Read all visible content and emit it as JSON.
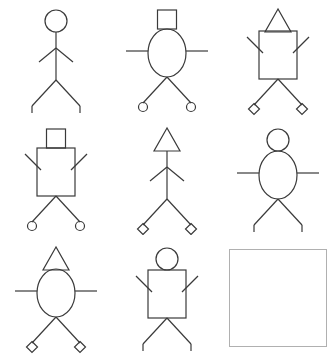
{
  "puzzle": {
    "title": "Stick Figure Matrix",
    "type": "3x3 visual analogy matrix",
    "rows": 3,
    "columns": 3,
    "background_color": "#ffffff",
    "stroke_color": "#3a3a3a",
    "answer_slot_border_color": "#b0b0b0",
    "attributes": {
      "head_shapes": [
        "circle",
        "square",
        "triangle"
      ],
      "torso_shapes": [
        "none",
        "ellipse",
        "rectangle"
      ],
      "arm_positions": [
        "down",
        "horizontal",
        "up"
      ],
      "foot_shapes": [
        "line",
        "circle",
        "diamond"
      ]
    }
  },
  "cells": [
    {
      "index": 1,
      "row": 1,
      "column": 1,
      "name": "figure-1",
      "head": "circle",
      "torso": "none",
      "arms": "down",
      "feet": "line",
      "empty": false,
      "label": "circle head, no torso, arms down, line feet"
    },
    {
      "index": 2,
      "row": 1,
      "column": 2,
      "name": "figure-2",
      "head": "square",
      "torso": "ellipse",
      "arms": "horizontal",
      "feet": "circle",
      "empty": false,
      "label": "square head, ellipse torso, arms horizontal, circle feet"
    },
    {
      "index": 3,
      "row": 1,
      "column": 3,
      "name": "figure-3",
      "head": "triangle",
      "torso": "rectangle",
      "arms": "up",
      "feet": "diamond",
      "empty": false,
      "label": "triangle head, rectangle torso, arms up, diamond feet"
    },
    {
      "index": 4,
      "row": 2,
      "column": 1,
      "name": "figure-4",
      "head": "square",
      "torso": "rectangle",
      "arms": "up",
      "feet": "circle",
      "empty": false,
      "label": "square head, rectangle torso, arms up, circle feet"
    },
    {
      "index": 5,
      "row": 2,
      "column": 2,
      "name": "figure-5",
      "head": "triangle",
      "torso": "none",
      "arms": "down",
      "feet": "diamond",
      "empty": false,
      "label": "triangle head, no torso, arms down, diamond feet"
    },
    {
      "index": 6,
      "row": 2,
      "column": 3,
      "name": "figure-6",
      "head": "circle",
      "torso": "ellipse",
      "arms": "horizontal",
      "feet": "line",
      "empty": false,
      "label": "circle head, ellipse torso, arms horizontal, line feet"
    },
    {
      "index": 7,
      "row": 3,
      "column": 1,
      "name": "figure-7",
      "head": "triangle",
      "torso": "ellipse",
      "arms": "horizontal",
      "feet": "diamond",
      "empty": false,
      "label": "triangle head, ellipse torso, arms horizontal, diamond feet"
    },
    {
      "index": 8,
      "row": 3,
      "column": 2,
      "name": "figure-8",
      "head": "circle",
      "torso": "rectangle",
      "arms": "up",
      "feet": "line",
      "empty": false,
      "label": "circle head, rectangle torso, arms up, line feet"
    },
    {
      "index": 9,
      "row": 3,
      "column": 3,
      "name": "answer-slot",
      "head": null,
      "torso": null,
      "arms": null,
      "feet": null,
      "empty": true,
      "label": "empty answer slot"
    }
  ]
}
